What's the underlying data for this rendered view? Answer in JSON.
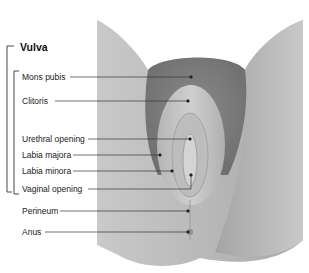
{
  "diagram": {
    "title": "Vulva",
    "group_bracket_items": [
      "Mons pubis",
      "Clitoris",
      "Urethral opening",
      "Labia majora",
      "Labia minora",
      "Vaginal opening"
    ],
    "labels": [
      {
        "id": "mons-pubis",
        "text": "Mons pubis"
      },
      {
        "id": "clitoris",
        "text": "Clitoris"
      },
      {
        "id": "urethral-opening",
        "text": "Urethral opening"
      },
      {
        "id": "labia-majora",
        "text": "Labia majora"
      },
      {
        "id": "labia-minora",
        "text": "Labia minora"
      },
      {
        "id": "vaginal-opening",
        "text": "Vaginal opening"
      },
      {
        "id": "perineum",
        "text": "Perineum"
      },
      {
        "id": "anus",
        "text": "Anus"
      }
    ],
    "colors": {
      "text": "#222222",
      "leader_line": "#333333",
      "illustration_light": "#d8d8d8",
      "illustration_mid": "#a8a8a8",
      "illustration_dark": "#6e6e6e"
    }
  }
}
